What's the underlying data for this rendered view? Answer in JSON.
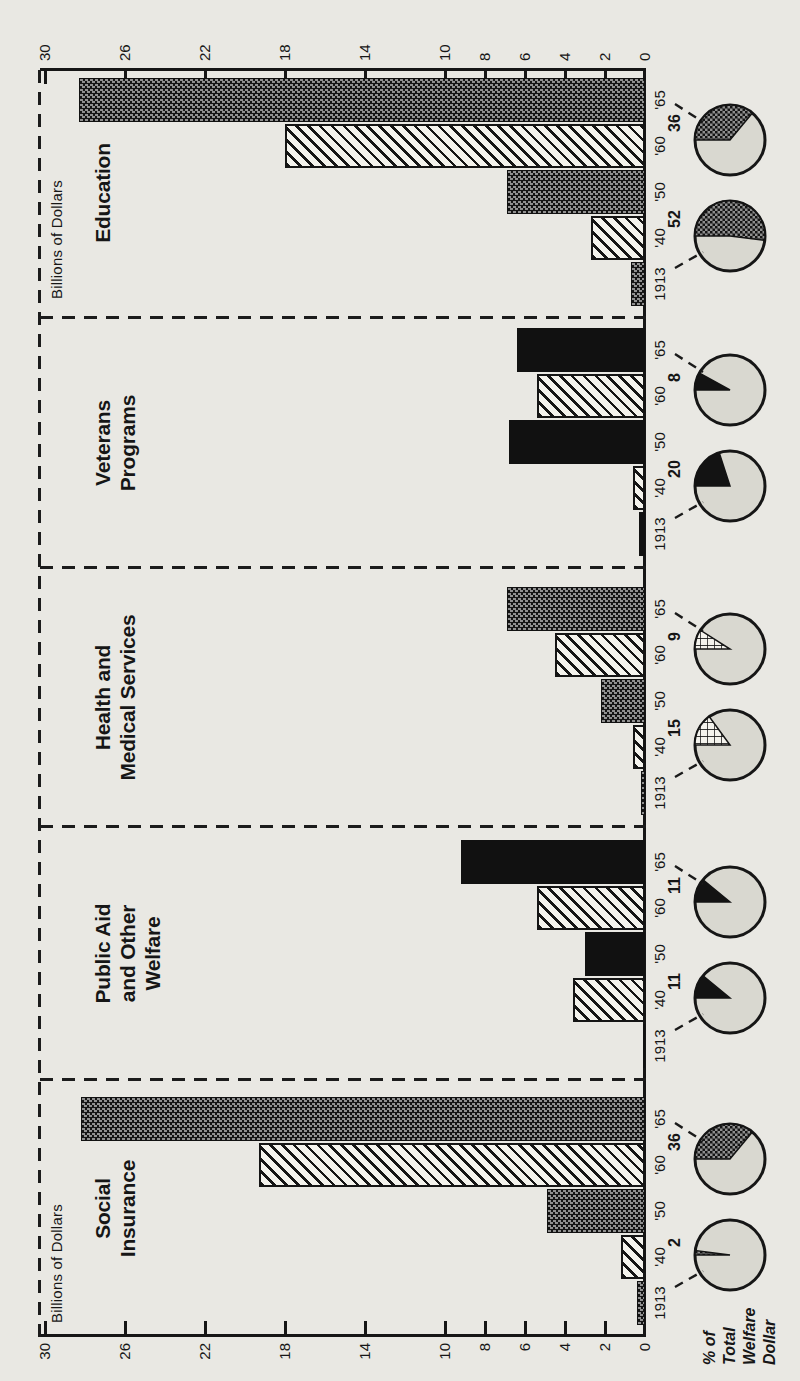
{
  "page": {
    "background": "#e9e8e3",
    "ink": "#161616",
    "paper": "#f4f3ed",
    "pie_face": "#d9d8d0"
  },
  "axis": {
    "title": "Billions of Dollars",
    "ticks": [
      0,
      2,
      4,
      6,
      8,
      10,
      14,
      18,
      22,
      26,
      30
    ],
    "max": 30
  },
  "footer": {
    "lines": [
      "% of",
      "Total",
      "Welfare",
      "Dollar"
    ]
  },
  "years": [
    "1913",
    "'40",
    "'50",
    "'60",
    "'65"
  ],
  "sections": [
    {
      "title_lines": [
        "Social",
        "Insurance"
      ],
      "values": [
        0.4,
        1.2,
        4.9,
        19.3,
        28.2
      ],
      "patterns": [
        "stipple",
        "stripe",
        "stipple",
        "stripe",
        "stipple"
      ],
      "pies": [
        {
          "year": "1913",
          "pct": 2,
          "label": "2",
          "fill": "stipple"
        },
        {
          "year": "'65",
          "pct": 36,
          "label": "36",
          "fill": "stipple"
        }
      ]
    },
    {
      "title_lines": [
        "Public Aid",
        "and Other",
        "Welfare"
      ],
      "values": [
        0.1,
        3.6,
        3.0,
        5.4,
        9.2
      ],
      "patterns": [
        "black",
        "stripe",
        "black",
        "stripe",
        "black"
      ],
      "pies": [
        {
          "year": "1913",
          "pct": 11,
          "label": "11",
          "fill": "black"
        },
        {
          "year": "'65",
          "pct": 11,
          "label": "11",
          "fill": "black"
        }
      ]
    },
    {
      "title_lines": [
        "Health and",
        "Medical Services"
      ],
      "values": [
        0.2,
        0.6,
        2.2,
        4.5,
        6.9
      ],
      "patterns": [
        "stipple",
        "stripe",
        "stipple",
        "stripe",
        "stipple"
      ],
      "pies": [
        {
          "year": "1913",
          "pct": 15,
          "label": "15",
          "fill": "crosshatch"
        },
        {
          "year": "'65",
          "pct": 9,
          "label": "9",
          "fill": "crosshatch"
        }
      ]
    },
    {
      "title_lines": [
        "Veterans",
        "Programs"
      ],
      "values": [
        0.3,
        0.6,
        6.8,
        5.4,
        6.4
      ],
      "patterns": [
        "black",
        "stripe",
        "black",
        "stripe",
        "black"
      ],
      "pies": [
        {
          "year": "1913",
          "pct": 20,
          "label": "20",
          "fill": "black"
        },
        {
          "year": "'65",
          "pct": 8,
          "label": "8",
          "fill": "black"
        }
      ]
    },
    {
      "title_lines": [
        "Education"
      ],
      "values": [
        0.7,
        2.7,
        6.9,
        18.0,
        28.3
      ],
      "patterns": [
        "stipple",
        "stripe",
        "stipple",
        "stripe",
        "stipple"
      ],
      "pies": [
        {
          "year": "1913",
          "pct": 52,
          "label": "52",
          "fill": "stipple"
        },
        {
          "year": "'65",
          "pct": 36,
          "label": "36",
          "fill": "stipple"
        }
      ]
    }
  ],
  "chart_data": {
    "type": "bar",
    "title": "",
    "ylabel": "Billions of Dollars",
    "ylim": [
      0,
      30
    ],
    "yticks": [
      0,
      2,
      4,
      6,
      8,
      10,
      14,
      18,
      22,
      26,
      30
    ],
    "categories": [
      "1913",
      "'40",
      "'50",
      "'60",
      "'65"
    ],
    "series": [
      {
        "name": "Social Insurance",
        "values": [
          0.4,
          1.2,
          4.9,
          19.3,
          28.2
        ]
      },
      {
        "name": "Public Aid and Other Welfare",
        "values": [
          0.1,
          3.6,
          3.0,
          5.4,
          9.2
        ]
      },
      {
        "name": "Health and Medical Services",
        "values": [
          0.2,
          0.6,
          2.2,
          4.5,
          6.9
        ]
      },
      {
        "name": "Veterans Programs",
        "values": [
          0.3,
          0.6,
          6.8,
          5.4,
          6.4
        ]
      },
      {
        "name": "Education",
        "values": [
          0.7,
          2.7,
          6.9,
          18.0,
          28.3
        ]
      }
    ],
    "pies": {
      "label": "% of Total Welfare Dollar",
      "unit": "percent",
      "entries": [
        {
          "section": "Social Insurance",
          "y1913": 2,
          "y1965": 36
        },
        {
          "section": "Public Aid and Other Welfare",
          "y1913": 11,
          "y1965": 11
        },
        {
          "section": "Health and Medical Services",
          "y1913": 15,
          "y1965": 9
        },
        {
          "section": "Veterans Programs",
          "y1913": 20,
          "y1965": 8
        },
        {
          "section": "Education",
          "y1913": 52,
          "y1965": 36
        }
      ]
    },
    "legend_position": "none",
    "grid": false,
    "orientation_note": "figure printed rotated 90deg on portrait page"
  }
}
